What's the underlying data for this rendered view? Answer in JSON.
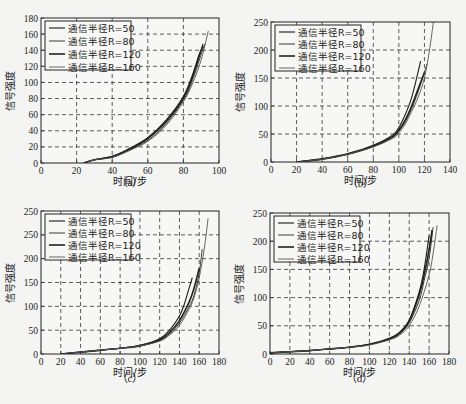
{
  "chart_data": [
    {
      "id": "a",
      "type": "line",
      "caption": "（a）",
      "xlabel": "时间/步",
      "ylabel": "信号强度",
      "xlim": [
        0,
        100
      ],
      "ylim": [
        0,
        180
      ],
      "xticks": [
        "0",
        "20",
        "40",
        "60",
        "80",
        "100"
      ],
      "yticks": [
        "0",
        "20",
        "40",
        "60",
        "80",
        "100",
        "120",
        "140",
        "160",
        "180"
      ],
      "grid": true,
      "legend_position": "upper left",
      "legend": [
        "通信半径R=50",
        "通信半径R=80",
        "通信半径R=120",
        "通信半径R=160"
      ],
      "series": [
        {
          "name": "通信半径R=50",
          "x": [
            24,
            30,
            40,
            50,
            60,
            70,
            80,
            85,
            90,
            91
          ],
          "y": [
            0,
            4,
            8,
            17,
            30,
            50,
            80,
            105,
            140,
            148
          ]
        },
        {
          "name": "通信半径R=80",
          "x": [
            24,
            30,
            40,
            50,
            60,
            70,
            80,
            85,
            90,
            92
          ],
          "y": [
            0,
            4,
            7,
            16,
            28,
            48,
            78,
            102,
            135,
            148
          ]
        },
        {
          "name": "通信半径R=120",
          "x": [
            24,
            30,
            40,
            50,
            60,
            70,
            80,
            85,
            89,
            91
          ],
          "y": [
            0,
            4,
            8,
            18,
            31,
            52,
            82,
            108,
            135,
            145
          ]
        },
        {
          "name": "通信半径R=160",
          "x": [
            24,
            30,
            40,
            50,
            60,
            70,
            80,
            85,
            90,
            94
          ],
          "y": [
            0,
            4,
            7,
            16,
            27,
            46,
            76,
            98,
            128,
            164
          ]
        }
      ]
    },
    {
      "id": "b",
      "type": "line",
      "caption": "（b）",
      "xlabel": "时间/步",
      "ylabel": "信号强度",
      "xlim": [
        0,
        140
      ],
      "ylim": [
        0,
        250
      ],
      "xticks": [
        "0",
        "20",
        "40",
        "60",
        "80",
        "100",
        "120",
        "140"
      ],
      "yticks": [
        "0",
        "50",
        "100",
        "150",
        "200",
        "250"
      ],
      "grid": true,
      "legend_position": "upper left",
      "legend": [
        "通信半径R=50",
        "通信半径R=80",
        "通信半径R=120",
        "通信半径R=160"
      ],
      "series": [
        {
          "name": "通信半径R=50",
          "x": [
            20,
            40,
            60,
            80,
            95,
            100,
            105,
            110,
            115,
            117
          ],
          "y": [
            0,
            6,
            15,
            30,
            48,
            62,
            85,
            115,
            160,
            180
          ]
        },
        {
          "name": "通信半径R=80",
          "x": [
            20,
            40,
            60,
            80,
            95,
            100,
            105,
            110,
            115,
            120,
            122
          ],
          "y": [
            0,
            5,
            14,
            28,
            44,
            55,
            72,
            95,
            125,
            160,
            175
          ]
        },
        {
          "name": "通信半径R=120",
          "x": [
            20,
            40,
            60,
            80,
            95,
            100,
            105,
            110,
            115,
            120
          ],
          "y": [
            0,
            5,
            14,
            28,
            45,
            57,
            75,
            100,
            130,
            160
          ]
        },
        {
          "name": "通信半径R=160",
          "x": [
            20,
            40,
            60,
            80,
            95,
            100,
            105,
            110,
            115,
            120,
            124,
            127
          ],
          "y": [
            0,
            5,
            14,
            27,
            42,
            52,
            68,
            90,
            115,
            150,
            200,
            250
          ]
        }
      ]
    },
    {
      "id": "c",
      "type": "line",
      "caption": "（c）",
      "xlabel": "时间/步",
      "ylabel": "信号强度",
      "xlim": [
        0,
        180
      ],
      "ylim": [
        0,
        300
      ],
      "xticks": [
        "0",
        "20",
        "40",
        "60",
        "80",
        "100",
        "120",
        "140",
        "160",
        "180"
      ],
      "yticks": [
        "0",
        "50",
        "100",
        "150",
        "200",
        "250",
        "250"
      ],
      "grid": true,
      "legend_position": "upper left",
      "legend": [
        "通信半径R=50",
        "通信半径R=80",
        "通信半径R=120",
        "通信半径R=160"
      ],
      "series": [
        {
          "name": "通信半径R=50",
          "x": [
            20,
            40,
            60,
            80,
            100,
            120,
            130,
            140,
            145,
            150,
            153
          ],
          "y": [
            0,
            4,
            8,
            12,
            18,
            32,
            50,
            80,
            105,
            140,
            160
          ]
        },
        {
          "name": "通信半径R=80",
          "x": [
            20,
            40,
            60,
            80,
            100,
            120,
            130,
            140,
            150,
            155,
            160,
            163
          ],
          "y": [
            0,
            4,
            8,
            12,
            17,
            28,
            42,
            65,
            100,
            125,
            170,
            220
          ]
        },
        {
          "name": "通信半径R=120",
          "x": [
            20,
            40,
            60,
            80,
            100,
            120,
            130,
            140,
            150,
            155,
            160
          ],
          "y": [
            0,
            4,
            8,
            12,
            17,
            30,
            45,
            70,
            110,
            140,
            180
          ]
        },
        {
          "name": "通信半径R=160",
          "x": [
            20,
            40,
            60,
            80,
            100,
            120,
            130,
            140,
            150,
            155,
            160,
            165,
            169
          ],
          "y": [
            0,
            4,
            8,
            12,
            17,
            27,
            40,
            60,
            95,
            120,
            160,
            220,
            285
          ]
        }
      ]
    },
    {
      "id": "d",
      "type": "line",
      "caption": "（d）",
      "xlabel": "时间/步",
      "ylabel": "信号强度",
      "xlim": [
        0,
        180
      ],
      "ylim": [
        0,
        250
      ],
      "xticks": [
        "0",
        "20",
        "40",
        "60",
        "80",
        "100",
        "120",
        "140",
        "160",
        "180"
      ],
      "yticks": [
        "0",
        "50",
        "100",
        "150",
        "200",
        "250"
      ],
      "grid": true,
      "legend_position": "upper left",
      "legend": [
        "通信半径R=50",
        "通信半径R=80",
        "通信半径R=120",
        "通信半径R=160"
      ],
      "series": [
        {
          "name": "通信半径R=50",
          "x": [
            0,
            20,
            40,
            60,
            80,
            100,
            120,
            130,
            140,
            150,
            155,
            160
          ],
          "y": [
            2,
            4,
            6,
            9,
            12,
            17,
            28,
            38,
            60,
            110,
            150,
            210
          ]
        },
        {
          "name": "通信半径R=80",
          "x": [
            0,
            20,
            40,
            60,
            80,
            100,
            120,
            130,
            140,
            150,
            155,
            160,
            164
          ],
          "y": [
            2,
            4,
            6,
            9,
            12,
            17,
            26,
            35,
            55,
            95,
            130,
            170,
            225
          ]
        },
        {
          "name": "通信半径R=120",
          "x": [
            0,
            20,
            40,
            60,
            80,
            100,
            120,
            130,
            140,
            150,
            155,
            160,
            163
          ],
          "y": [
            2,
            4,
            6,
            9,
            12,
            17,
            27,
            37,
            58,
            105,
            140,
            185,
            220
          ]
        },
        {
          "name": "通信半径R=160",
          "x": [
            0,
            20,
            40,
            60,
            80,
            100,
            120,
            130,
            140,
            150,
            160,
            165,
            168
          ],
          "y": [
            2,
            4,
            6,
            9,
            12,
            16,
            25,
            33,
            50,
            85,
            140,
            190,
            228
          ]
        }
      ]
    }
  ],
  "layout": {
    "plots": [
      {
        "left": 41,
        "top": 18,
        "right": 219,
        "bottom": 163,
        "legend": {
          "x": 45,
          "y": 21,
          "w": 86,
          "h": 49
        },
        "caption_y": 186
      },
      {
        "left": 271,
        "top": 22,
        "right": 450,
        "bottom": 162,
        "legend": {
          "x": 275,
          "y": 25,
          "w": 86,
          "h": 46
        },
        "caption_y": 187
      },
      {
        "left": 41,
        "top": 211,
        "right": 219,
        "bottom": 354,
        "legend": {
          "x": 45,
          "y": 214,
          "w": 86,
          "h": 46
        },
        "caption_y": 382
      },
      {
        "left": 270,
        "top": 213,
        "right": 449,
        "bottom": 354,
        "legend": {
          "x": 274,
          "y": 216,
          "w": 86,
          "h": 46
        },
        "caption_y": 382
      }
    ],
    "line_colors": [
      "#1a1a1a",
      "#3a3a3a",
      "#222222",
      "#555555"
    ],
    "line_widths": [
      1.1,
      1.0,
      1.6,
      0.9
    ]
  }
}
